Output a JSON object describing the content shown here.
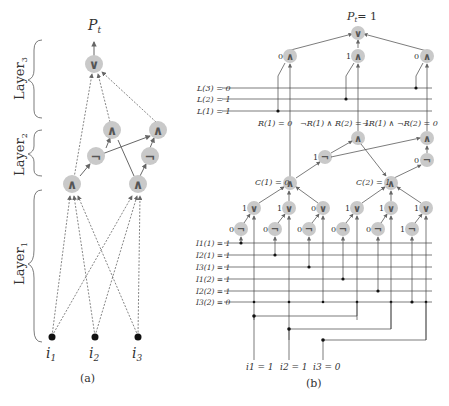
{
  "panel_a": {
    "caption": "(a)",
    "output_label": "P",
    "output_sub": "t",
    "layers": [
      {
        "name": "Layer",
        "sub": "3"
      },
      {
        "name": "Layer",
        "sub": "2"
      },
      {
        "name": "Layer",
        "sub": "1"
      }
    ],
    "inputs": [
      {
        "name": "i",
        "sub": "1"
      },
      {
        "name": "i",
        "sub": "2"
      },
      {
        "name": "i",
        "sub": "3"
      }
    ],
    "gates": {
      "or": "∨",
      "and": "∧",
      "not": "¬"
    }
  },
  "panel_b": {
    "caption": "(b)",
    "output_label": "P",
    "output_sub": "t",
    "output_value": "= 1",
    "top_and_values": [
      "0",
      "1",
      "0"
    ],
    "L_lines": [
      {
        "label": "L(3) = 0"
      },
      {
        "label": "L(2) = 1"
      },
      {
        "label": "L(1) = 1"
      }
    ],
    "R_labels": [
      "R(1) = 0",
      "¬R(1) ∧ R(2) = 1",
      "¬R(1) ∧ ¬R(2) = 0"
    ],
    "C_labels": [
      "C(1) = 0",
      "C(2) = 1"
    ],
    "not_mid_values": [
      "1",
      "0"
    ],
    "or_values": [
      "1",
      "1",
      "0",
      "1",
      "1",
      "1"
    ],
    "not_low_values": [
      "0",
      "0",
      "0",
      "0",
      "0",
      "1"
    ],
    "I_lines": [
      {
        "label": "I1(1) = 1"
      },
      {
        "label": "I2(1) = 1"
      },
      {
        "label": "I3(1) = 1"
      },
      {
        "label": "I1(2) = 1"
      },
      {
        "label": "I2(2) = 1"
      },
      {
        "label": "I3(2) = 0"
      }
    ],
    "inputs": [
      {
        "label": "i1 = 1"
      },
      {
        "label": "i2 = 1"
      },
      {
        "label": "i3 = 0"
      }
    ]
  }
}
